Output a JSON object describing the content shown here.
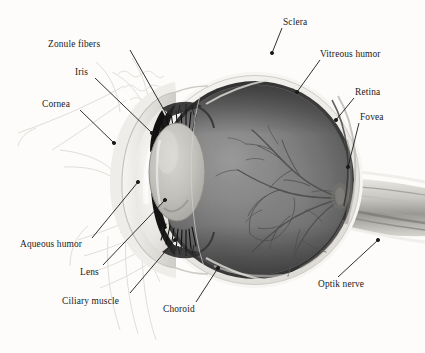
{
  "figure": {
    "kind": "anatomical-illustration",
    "style": "grayscale pencil/airbrush rendering",
    "background_color": "#fdfcfa",
    "ink_color": "#1a1a1a"
  },
  "labels": [
    {
      "id": "zonule-fibers",
      "text": "Zonule fibers",
      "x": 48,
      "y": 40,
      "align": "left",
      "leader": [
        [
          130,
          50
        ],
        [
          168,
          117
        ]
      ]
    },
    {
      "id": "iris",
      "text": "Iris",
      "x": 75,
      "y": 68,
      "align": "left",
      "leader": [
        [
          95,
          78
        ],
        [
          152,
          133
        ]
      ]
    },
    {
      "id": "cornea",
      "text": "Cornea",
      "x": 42,
      "y": 100,
      "align": "left",
      "leader": [
        [
          80,
          110
        ],
        [
          114,
          143
        ]
      ]
    },
    {
      "id": "aqueous-humor",
      "text": "Aqueous humor",
      "x": 20,
      "y": 240,
      "align": "left",
      "leader": [
        [
          92,
          238
        ],
        [
          138,
          182
        ]
      ]
    },
    {
      "id": "lens",
      "text": "Lens",
      "x": 80,
      "y": 268,
      "align": "left",
      "leader": [
        [
          103,
          265
        ],
        [
          165,
          200
        ]
      ]
    },
    {
      "id": "ciliary-muscle",
      "text": "Ciliary muscle",
      "x": 62,
      "y": 297,
      "align": "left",
      "leader": [
        [
          130,
          293
        ],
        [
          175,
          240
        ]
      ]
    },
    {
      "id": "choroid",
      "text": "Choroid",
      "x": 163,
      "y": 305,
      "align": "left",
      "leader": [
        [
          196,
          302
        ],
        [
          218,
          268
        ]
      ]
    },
    {
      "id": "sclera",
      "text": "Sclera",
      "x": 283,
      "y": 18,
      "align": "left",
      "leader": [
        [
          282,
          28
        ],
        [
          272,
          53
        ]
      ]
    },
    {
      "id": "vitreous-humor",
      "text": "Vitreous humor",
      "x": 320,
      "y": 50,
      "align": "left",
      "leader": [
        [
          320,
          60
        ],
        [
          297,
          92
        ]
      ]
    },
    {
      "id": "retina",
      "text": "Retina",
      "x": 355,
      "y": 88,
      "align": "left",
      "leader": [
        [
          354,
          98
        ],
        [
          336,
          120
        ]
      ]
    },
    {
      "id": "fovea",
      "text": "Fovea",
      "x": 360,
      "y": 113,
      "align": "left",
      "leader": [
        [
          359,
          123
        ],
        [
          348,
          167
        ]
      ]
    },
    {
      "id": "optik-nerve",
      "text": "Optik nerve",
      "x": 318,
      "y": 280,
      "align": "left",
      "leader": [
        [
          338,
          277
        ],
        [
          378,
          240
        ]
      ]
    }
  ],
  "anatomy": {
    "globe": {
      "cx": 255,
      "cy": 180,
      "r": 105
    },
    "lens": {
      "cx": 176,
      "cy": 172,
      "rx": 27,
      "ry": 47
    },
    "optic_disc": {
      "cx": 340,
      "cy": 196
    },
    "parts": [
      "sclera",
      "choroid",
      "retina",
      "vitreous humor",
      "cornea",
      "aqueous humor",
      "iris",
      "lens",
      "zonule fibers",
      "ciliary muscle",
      "fovea",
      "optic nerve",
      "retinal blood vessels"
    ]
  },
  "palette": {
    "sclera_outer": "#f2f0ee",
    "sclera_body": "#e3e0dc",
    "choroid_dark": "#3a3a3a",
    "vitreous_dark": "#4a4a4a",
    "vitreous_mid": "#6e6e6e",
    "vitreous_light": "#8d8d8d",
    "cornea_light": "#d9d7d3",
    "aqueous": "#eceae6",
    "lens_fill": "#b8b6b1",
    "iris_dark": "#141414",
    "vessel": "#5a5a5a",
    "sketch": "#dedcd8"
  }
}
